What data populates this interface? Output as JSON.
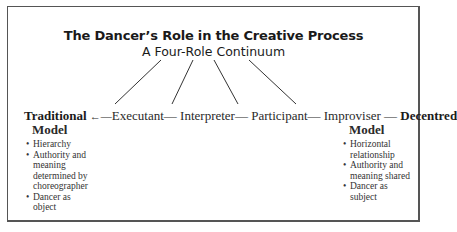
{
  "title": "The Dancer’s Role in the Creative Process",
  "subtitle": "A Four-Role Continuum",
  "left_pole": {
    "line1": "Traditional",
    "line2": "Model",
    "arrow": "←—",
    "bullets": [
      "Hierarchy",
      "Authority and meaning determined by choreographer",
      "Dancer as object"
    ]
  },
  "roles": [
    "Executant",
    "Interpreter",
    "Participant",
    "Improviser"
  ],
  "connector": "—",
  "right_pole": {
    "line1": "Decentred",
    "line2": "Model",
    "bullets": [
      "Horizontal relationship",
      "Authority and meaning shared",
      "Dancer as subject"
    ]
  }
}
